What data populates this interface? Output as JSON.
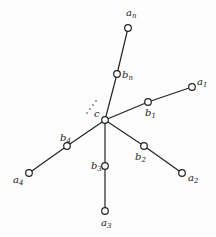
{
  "diagram": {
    "type": "tree",
    "center": {
      "id": "c",
      "label": "c",
      "x": 105,
      "y": 120
    },
    "nodes": [
      {
        "id": "an",
        "base": "a",
        "sub": "n",
        "x": 128,
        "y": 28,
        "lx": 126,
        "ly": 16
      },
      {
        "id": "bn",
        "base": "b",
        "sub": "n",
        "x": 117,
        "y": 74,
        "lx": 122,
        "ly": 78
      },
      {
        "id": "a1",
        "base": "a",
        "sub": "1",
        "x": 192,
        "y": 87,
        "lx": 197,
        "ly": 85
      },
      {
        "id": "b1",
        "base": "b",
        "sub": "1",
        "x": 148,
        "y": 102,
        "lx": 145,
        "ly": 116
      },
      {
        "id": "b2",
        "base": "b",
        "sub": "2",
        "x": 144,
        "y": 146,
        "lx": 135,
        "ly": 160
      },
      {
        "id": "a2",
        "base": "a",
        "sub": "2",
        "x": 182,
        "y": 173,
        "lx": 188,
        "ly": 181
      },
      {
        "id": "b3",
        "base": "b",
        "sub": "3",
        "x": 105,
        "y": 166,
        "lx": 91,
        "ly": 169
      },
      {
        "id": "a3",
        "base": "a",
        "sub": "3",
        "x": 105,
        "y": 211,
        "lx": 101,
        "ly": 226
      },
      {
        "id": "b4",
        "base": "b",
        "sub": "4",
        "x": 67,
        "y": 146,
        "lx": 60,
        "ly": 141
      },
      {
        "id": "a4",
        "base": "a",
        "sub": "4",
        "x": 29,
        "y": 173,
        "lx": 13,
        "ly": 183
      }
    ],
    "edges": [
      [
        "c",
        "bn"
      ],
      [
        "bn",
        "an"
      ],
      [
        "c",
        "b1"
      ],
      [
        "b1",
        "a1"
      ],
      [
        "c",
        "b2"
      ],
      [
        "b2",
        "a2"
      ],
      [
        "c",
        "b3"
      ],
      [
        "b3",
        "a3"
      ],
      [
        "c",
        "b4"
      ],
      [
        "b4",
        "a4"
      ]
    ],
    "ellipsis": {
      "label": "· · ·",
      "x": 90,
      "y": 106
    }
  }
}
